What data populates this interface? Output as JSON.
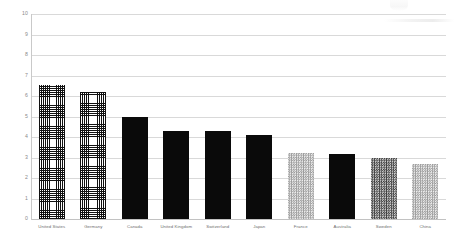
{
  "chart_data": {
    "type": "bar",
    "title": "",
    "subtitle": "",
    "xlabel": "",
    "ylabel": "",
    "ylim": [
      0,
      10
    ],
    "yticks": [
      0,
      1,
      2,
      3,
      4,
      5,
      6,
      7,
      8,
      9,
      10
    ],
    "ytick_labels": [
      "0",
      "1",
      "2",
      "3",
      "4",
      "5",
      "6",
      "7",
      "8",
      "9",
      "10"
    ],
    "grid": true,
    "legend": "none",
    "categories": [
      "United States",
      "Germany",
      "Canada",
      "United Kingdom",
      "Switzerland",
      "Japan",
      "France",
      "Australia",
      "Sweden",
      "China"
    ],
    "values": [
      6.55,
      6.2,
      5.0,
      4.3,
      4.3,
      4.1,
      3.2,
      3.15,
      3.0,
      2.7
    ],
    "bar_styles": [
      "crosshatch",
      "crosshatch",
      "solid",
      "solid",
      "solid",
      "solid",
      "check-light",
      "solid",
      "check-dark",
      "check-light"
    ],
    "colors": {
      "solid": "#0a0a0a",
      "crosshatch_line": "#111111",
      "check_light": "#9a9a9a",
      "check_dark": "#3d3d3d",
      "gridline": "#d9d9d9",
      "axis": "#c9c9c9",
      "tick_text": "#8a8a8a",
      "category_text": "#6e6e6e",
      "background": "#ffffff"
    }
  }
}
